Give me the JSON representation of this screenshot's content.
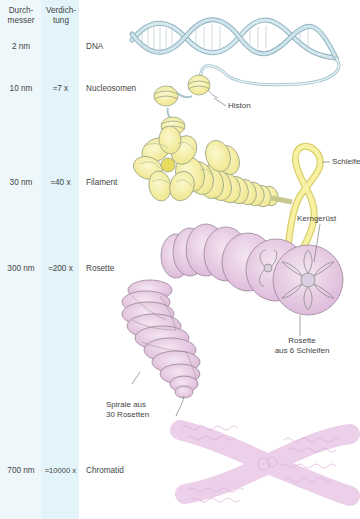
{
  "table": {
    "headers": {
      "diameter": "Durch-\nmesser",
      "compaction": "Verdich-\ntung"
    },
    "rows": [
      {
        "diameter": "2 nm",
        "compaction": "",
        "level": "DNA"
      },
      {
        "diameter": "10 nm",
        "compaction": "≈7 x",
        "level": "Nucleosomen"
      },
      {
        "diameter": "30 nm",
        "compaction": "≈40 x",
        "level": "Filament"
      },
      {
        "diameter": "300 nm",
        "compaction": "≈200 x",
        "level": "Rosette"
      },
      {
        "diameter": "700 nm",
        "compaction": "≈10000 x",
        "level": "Chromatid"
      }
    ]
  },
  "labels": {
    "histone": "Histon",
    "loop": "Schleife",
    "scaffold": "Kerngerüst",
    "rosette_line1": "Rosette",
    "rosette_line2": "aus 6 Schleifen",
    "spiral_line1": "Spirale aus",
    "spiral_line2": "30 Rosetten"
  },
  "colors": {
    "band1": "#eef8fb",
    "band2": "#e2f3f9",
    "dna": "#a9cbd6",
    "nucleosome": "#f6f1a6",
    "rosette": "#e8cbe4",
    "chromatid": "#e9c6e6"
  }
}
